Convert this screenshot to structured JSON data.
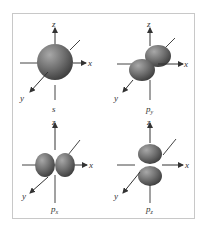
{
  "figure": {
    "panels": [
      {
        "id": "s",
        "label": "s",
        "sub": "",
        "axes": {
          "x": "x",
          "y": "y",
          "z": "z"
        },
        "shape": "sphere"
      },
      {
        "id": "py",
        "label": "p",
        "sub": "y",
        "axes": {
          "x": "x",
          "y": "y",
          "z": "z"
        },
        "shape": "dumbbell-along-y"
      },
      {
        "id": "px",
        "label": "p",
        "sub": "x",
        "axes": {
          "x": "x",
          "y": "y",
          "z": "z"
        },
        "shape": "dumbbell-along-x"
      },
      {
        "id": "pz",
        "label": "p",
        "sub": "z",
        "axes": {
          "x": "x",
          "y": "y",
          "z": "z"
        },
        "shape": "dumbbell-along-z"
      }
    ],
    "colors": {
      "frame": "#c8c8c8",
      "axis": "#333333",
      "orbital_light": "#9a9a9a",
      "orbital_mid": "#6e6e6e",
      "orbital_dark": "#3c3c3c"
    }
  }
}
